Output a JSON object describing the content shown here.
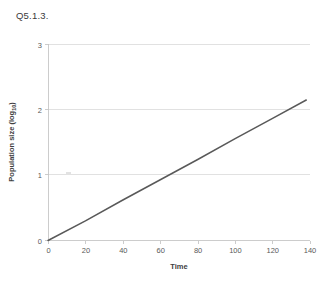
{
  "page": {
    "title": "Q5.1.3."
  },
  "chart_data": {
    "type": "line",
    "title": "",
    "xlabel": "Time",
    "ylabel": "Population size (log10)",
    "ylabel_base": "Population size (log",
    "ylabel_sub": "10",
    "ylabel_tail": ")",
    "xlim": [
      0,
      140
    ],
    "ylim": [
      0,
      3
    ],
    "xticks": [
      0,
      20,
      40,
      60,
      80,
      100,
      120,
      140
    ],
    "yticks": [
      0,
      1,
      2,
      3
    ],
    "xtick_labels": [
      "0",
      "20",
      "40",
      "60",
      "80",
      "100",
      "120",
      "140"
    ],
    "ytick_labels": [
      "0",
      "1",
      "2",
      "3"
    ],
    "grid": "horizontal",
    "legend": "none",
    "series": [
      {
        "name": "Population size",
        "color": "#595959",
        "x": [
          0,
          20,
          40,
          60,
          80,
          100,
          120,
          138
        ],
        "values": [
          0,
          0.3,
          0.62,
          0.93,
          1.24,
          1.56,
          1.87,
          2.15
        ]
      }
    ]
  }
}
